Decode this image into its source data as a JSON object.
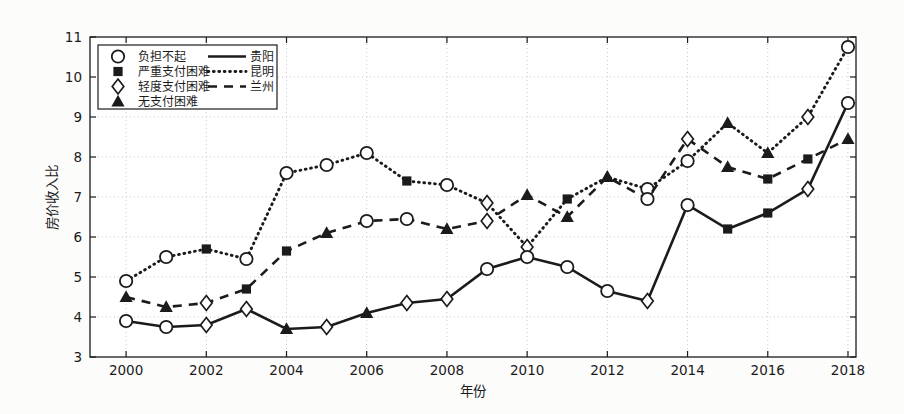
{
  "figure": {
    "background": "#fcfcfb",
    "plot_background": "#ffffff",
    "ink_color": "#1b1b1b",
    "grid_color": "#c9c9c9"
  },
  "chart_data": {
    "type": "line",
    "title": "",
    "xlabel": "年份",
    "ylabel": "房价收入比",
    "xlim": [
      1999.1,
      2018.2
    ],
    "ylim": [
      3,
      11
    ],
    "x_ticks": [
      2000,
      2002,
      2004,
      2006,
      2008,
      2010,
      2012,
      2014,
      2016,
      2018
    ],
    "y_ticks": [
      3,
      4,
      5,
      6,
      7,
      8,
      9,
      10,
      11
    ],
    "grid": true,
    "legend_position": "top-left",
    "x": [
      2000,
      2001,
      2002,
      2003,
      2004,
      2005,
      2006,
      2007,
      2008,
      2009,
      2010,
      2011,
      2012,
      2013,
      2014,
      2015,
      2016,
      2017,
      2018
    ],
    "series": [
      {
        "name": "昆明",
        "line_style": "dotted",
        "values": [
          4.9,
          5.5,
          5.7,
          5.45,
          7.6,
          7.8,
          8.1,
          7.4,
          7.3,
          6.85,
          5.75,
          6.95,
          7.5,
          7.2,
          7.9,
          8.85,
          8.1,
          9.0,
          10.75
        ],
        "markers": [
          "circle",
          "circle",
          "square",
          "circle",
          "circle",
          "circle",
          "circle",
          "square",
          "circle",
          "diamond",
          "diamond",
          "square",
          "triangle",
          "circle",
          "circle",
          "triangle",
          "triangle",
          "diamond",
          "circle"
        ]
      },
      {
        "name": "兰州",
        "line_style": "dashed",
        "values": [
          4.5,
          4.25,
          4.35,
          4.7,
          5.65,
          6.1,
          6.4,
          6.45,
          6.2,
          6.4,
          7.05,
          6.5,
          7.5,
          6.95,
          8.45,
          7.75,
          7.45,
          7.95,
          8.45
        ],
        "markers": [
          "triangle",
          "triangle",
          "diamond",
          "square",
          "square",
          "triangle",
          "circle",
          "circle",
          "triangle",
          "diamond",
          "triangle",
          "triangle",
          "triangle",
          "circle",
          "diamond",
          "triangle",
          "square",
          "square",
          "triangle"
        ]
      },
      {
        "name": "贵阳",
        "line_style": "solid",
        "values": [
          3.9,
          3.75,
          3.8,
          4.2,
          3.7,
          3.75,
          4.1,
          4.35,
          4.45,
          5.2,
          5.5,
          5.25,
          4.65,
          4.4,
          6.8,
          6.2,
          6.6,
          7.2,
          9.35
        ],
        "markers": [
          "circle",
          "circle",
          "diamond",
          "diamond",
          "triangle",
          "diamond",
          "triangle",
          "diamond",
          "diamond",
          "circle",
          "circle",
          "circle",
          "circle",
          "diamond",
          "circle",
          "square",
          "square",
          "diamond",
          "circle"
        ]
      }
    ],
    "marker_legend": [
      {
        "marker": "circle",
        "label": "负担不起"
      },
      {
        "marker": "square",
        "label": "严重支付困难"
      },
      {
        "marker": "diamond",
        "label": "轻度支付困难"
      },
      {
        "marker": "triangle",
        "label": "无支付困难"
      }
    ],
    "line_legend": [
      {
        "line_style": "solid",
        "label": "贵阳"
      },
      {
        "line_style": "dotted",
        "label": "昆明"
      },
      {
        "line_style": "dashed",
        "label": "兰州"
      }
    ]
  }
}
